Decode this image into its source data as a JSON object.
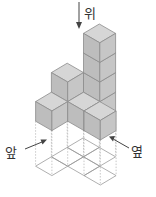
{
  "diagram": {
    "type": "isometric-cube-stack",
    "labels": {
      "top": "위",
      "front": "앞",
      "side": "옆"
    },
    "colors": {
      "top_face": "#d6d6d6",
      "left_face": "#bdbdbd",
      "right_face": "#c6c6c6",
      "edge": "#8c8c8c",
      "grid_line": "#9a9a9a",
      "dash_line": "#b0b0b0",
      "arrow": "#444444",
      "label": "#333333"
    },
    "cells": [
      {
        "a": 0,
        "b": 0,
        "height": 1
      },
      {
        "a": 1,
        "b": 0,
        "height": 4
      },
      {
        "a": 0,
        "b": 1,
        "height": 2
      },
      {
        "a": 0,
        "b": 2,
        "height": 1
      },
      {
        "a": 1,
        "b": 1,
        "height": 1
      },
      {
        "a": 2,
        "b": 1,
        "height": 1
      }
    ],
    "total_cubes": 10
  }
}
